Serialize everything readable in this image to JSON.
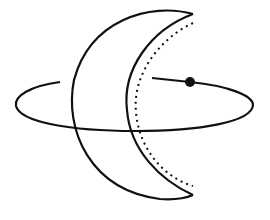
{
  "diagram": {
    "colors": {
      "stroke": "#111111",
      "background": "#ffffff",
      "dot": "#111111"
    },
    "elements": [
      {
        "id": "crescent",
        "type": "crescent"
      },
      {
        "id": "inner-dotted-arc",
        "type": "dotted-arc"
      },
      {
        "id": "orbit-ellipse",
        "type": "ellipse"
      },
      {
        "id": "orbit-dot",
        "type": "dot"
      }
    ]
  }
}
